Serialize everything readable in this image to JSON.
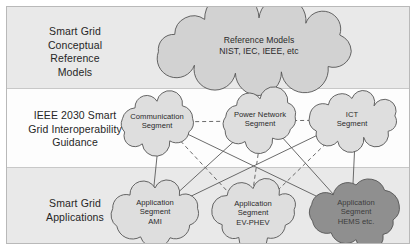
{
  "diagram": {
    "colors": {
      "band_shaded": "#e9e9e9",
      "band_plain": "#fdfdfd",
      "frame_border": "#b9b9b9",
      "band_divider": "#c8c8c8",
      "cloud_fill_light": "#d2d2d2",
      "cloud_fill_pale": "#dedede",
      "cloud_fill_dark": "#8f8f8f",
      "cloud_stroke": "#555555",
      "edge_stroke": "#5a5a5a",
      "text": "#262626"
    },
    "bands": [
      {
        "id": "conceptual-reference-models",
        "label": "Smart Grid\nConceptual\nReference\nModels",
        "label_lines": [
          "Smart Grid",
          "Conceptual",
          "Reference",
          "Models"
        ],
        "shaded": true
      },
      {
        "id": "ieee-2030-interoperability",
        "label": "IEEE 2030 Smart\nGrid Interoperability\nGuidance",
        "label_lines": [
          "IEEE 2030 Smart",
          "Grid Interoperability",
          "Guidance"
        ],
        "shaded": false
      },
      {
        "id": "smart-grid-applications",
        "label": "Smart Grid\nApplications",
        "label_lines": [
          "Smart Grid",
          "Applications"
        ],
        "shaded": true
      }
    ],
    "nodes": [
      {
        "id": "reference-models",
        "band": "conceptual-reference-models",
        "lines": [
          "Reference Models",
          "NIST, IEC, IEEE, etc"
        ],
        "shade": "light",
        "size": "large"
      },
      {
        "id": "communication-segment",
        "band": "ieee-2030-interoperability",
        "lines": [
          "Communication",
          "Segment"
        ],
        "shade": "pale",
        "size": "medium"
      },
      {
        "id": "power-network-segment",
        "band": "ieee-2030-interoperability",
        "lines": [
          "Power Network",
          "Segment"
        ],
        "shade": "pale",
        "size": "medium"
      },
      {
        "id": "ict-segment",
        "band": "ieee-2030-interoperability",
        "lines": [
          "ICT",
          "Segment"
        ],
        "shade": "pale",
        "size": "medium"
      },
      {
        "id": "application-segment-ami",
        "band": "smart-grid-applications",
        "lines": [
          "Application",
          "Segment",
          "AMI"
        ],
        "shade": "pale",
        "size": "medium"
      },
      {
        "id": "application-segment-ev-phev",
        "band": "smart-grid-applications",
        "lines": [
          "Application",
          "Segment",
          "EV-PHEV"
        ],
        "shade": "pale",
        "size": "medium"
      },
      {
        "id": "application-segment-hems",
        "band": "smart-grid-applications",
        "lines": [
          "Application",
          "Segment",
          "HEMS etc."
        ],
        "shade": "dark",
        "size": "medium"
      }
    ],
    "edges": [
      {
        "from": "communication-segment",
        "to": "application-segment-ami",
        "style": "solid"
      },
      {
        "from": "communication-segment",
        "to": "application-segment-ev-phev",
        "style": "dashed"
      },
      {
        "from": "communication-segment",
        "to": "application-segment-hems",
        "style": "solid"
      },
      {
        "from": "power-network-segment",
        "to": "application-segment-ami",
        "style": "solid"
      },
      {
        "from": "power-network-segment",
        "to": "application-segment-ev-phev",
        "style": "dashed"
      },
      {
        "from": "power-network-segment",
        "to": "application-segment-hems",
        "style": "solid"
      },
      {
        "from": "ict-segment",
        "to": "application-segment-ami",
        "style": "solid"
      },
      {
        "from": "ict-segment",
        "to": "application-segment-ev-phev",
        "style": "dashed"
      },
      {
        "from": "ict-segment",
        "to": "application-segment-hems",
        "style": "solid"
      },
      {
        "from": "communication-segment",
        "to": "ict-segment",
        "style": "dashed"
      }
    ]
  }
}
